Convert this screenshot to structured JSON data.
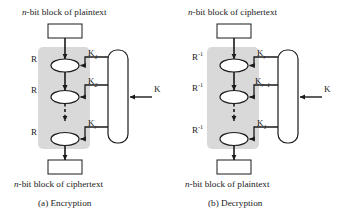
{
  "figure": {
    "background_color": "#ffffff",
    "stroke_color": "#1a1a1a",
    "shade_color": "#d9d9d9",
    "fill_color": "#ffffff"
  },
  "panels": [
    {
      "id": "encryption",
      "top_label_italic": "n",
      "top_label": "-bit block of plaintext",
      "bottom_label_italic": "n",
      "bottom_label": "-bit block of ciphertext",
      "subcaption": "(a) Encryption",
      "round_labels": [
        "R",
        "R",
        "R"
      ],
      "round_superscripts": [
        "",
        "",
        ""
      ],
      "key_labels": [
        {
          "base": "K",
          "sub": "1"
        },
        {
          "base": "K",
          "sub": "2"
        },
        {
          "base": "K",
          "sub": "r"
        }
      ],
      "master_key_label": "K"
    },
    {
      "id": "decryption",
      "top_label_italic": "n",
      "top_label": "-bit block of ciphertext",
      "bottom_label_italic": "n",
      "bottom_label": "-bit block of plaintext",
      "subcaption": "(b) Decryption",
      "round_labels": [
        "R",
        "R",
        "R"
      ],
      "round_superscripts": [
        "-1",
        "-1",
        "-1"
      ],
      "key_labels": [
        {
          "base": "K",
          "sub": "r"
        },
        {
          "base": "K",
          "sub": "r–1"
        },
        {
          "base": "K",
          "sub": "1"
        }
      ],
      "master_key_label": "K"
    }
  ]
}
